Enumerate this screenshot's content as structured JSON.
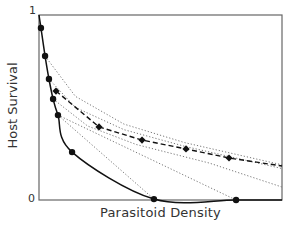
{
  "chart_data": {
    "type": "line",
    "title": "",
    "xlabel": "Parasitoid Density",
    "ylabel": "Host Survival",
    "xlim": [
      0,
      1
    ],
    "ylim": [
      0,
      1
    ],
    "y_ticks": [
      "0",
      "1"
    ],
    "x_ticks": [],
    "grid": false,
    "legend": null,
    "series": [
      {
        "name": "solid-curve",
        "style": "solid",
        "marker": "circle",
        "x": [
          0,
          0.008,
          0.025,
          0.041,
          0.058,
          0.078,
          0.136,
          0.473,
          0.811,
          1.0
        ],
        "y": [
          1.0,
          0.93,
          0.778,
          0.654,
          0.546,
          0.459,
          0.259,
          0.005,
          0.0,
          0.0
        ],
        "marker_x": [
          0.008,
          0.025,
          0.041,
          0.058,
          0.078,
          0.136,
          0.473,
          0.811
        ],
        "marker_y": [
          0.93,
          0.778,
          0.654,
          0.546,
          0.459,
          0.259,
          0.005,
          0.0
        ]
      },
      {
        "name": "dashed-curve",
        "style": "dashed",
        "marker": "diamond",
        "x": [
          0.07,
          0.247,
          0.424,
          0.605,
          0.782,
          1.0
        ],
        "y": [
          0.589,
          0.395,
          0.324,
          0.276,
          0.227,
          0.184
        ],
        "marker_x": [
          0.07,
          0.247,
          0.424,
          0.605,
          0.782
        ],
        "marker_y": [
          0.589,
          0.395,
          0.324,
          0.276,
          0.227
        ]
      },
      {
        "name": "dotted-1",
        "style": "dotted",
        "x": [
          0.025,
          0.15,
          0.35,
          0.6,
          1.0
        ],
        "y": [
          0.778,
          0.56,
          0.41,
          0.31,
          0.19
        ]
      },
      {
        "name": "dotted-2",
        "style": "dotted",
        "x": [
          0.041,
          0.15,
          0.35,
          0.6,
          1.0
        ],
        "y": [
          0.654,
          0.5,
          0.38,
          0.29,
          0.17
        ]
      },
      {
        "name": "dotted-3",
        "style": "dotted",
        "x": [
          0.058,
          0.2,
          0.4,
          0.7,
          1.0
        ],
        "y": [
          0.546,
          0.4,
          0.3,
          0.2,
          0.07
        ]
      },
      {
        "name": "dotted-4-to-zero",
        "style": "dotted",
        "x": [
          0.078,
          0.811
        ],
        "y": [
          0.459,
          0.0
        ]
      },
      {
        "name": "dotted-5-to-zero",
        "style": "dotted",
        "x": [
          0.078,
          0.473
        ],
        "y": [
          0.459,
          0.005
        ]
      }
    ]
  },
  "labels": {
    "xlabel": "Parasitoid Density",
    "ylabel": "Host Survival",
    "ytick_top": "1",
    "ytick_bottom": "0"
  },
  "colors": {
    "axis": "#555555",
    "line": "#111111",
    "dotted": "#777777"
  }
}
